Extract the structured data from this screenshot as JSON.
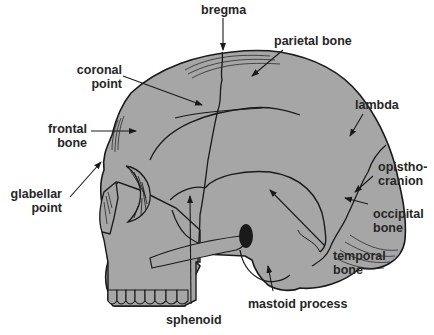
{
  "figure": {
    "title_clipped": "",
    "colors": {
      "bone_fill": "#a6a6a6",
      "outline": "#1a1a1a",
      "text": "#262626",
      "background": "#ffffff"
    }
  },
  "labels": {
    "bregma": "bregma",
    "parietal_bone": "parietal bone",
    "coronal_point_1": "coronal",
    "coronal_point_2": "point",
    "lambda": "lambda",
    "frontal_bone_1": "frontal",
    "frontal_bone_2": "bone",
    "opisthocranion_1": "opistho-",
    "opisthocranion_2": "cranion",
    "glabellar_point_1": "glabellar",
    "glabellar_point_2": "point",
    "occipital_bone_1": "occipital",
    "occipital_bone_2": "bone",
    "temporal_bone_1": "temporal",
    "temporal_bone_2": "bone",
    "mastoid_process": "mastoid process",
    "sphenoid": "sphenoid"
  }
}
